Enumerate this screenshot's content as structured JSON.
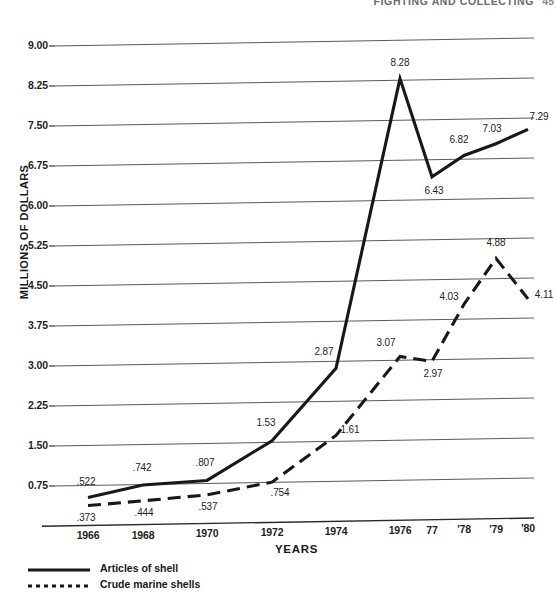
{
  "running_head": {
    "text": "FIGHTING AND COLLECTING",
    "folio": "45"
  },
  "chart_data": {
    "type": "line",
    "title": "",
    "xlabel": "YEARS",
    "ylabel": "MILLIONS OF DOLLARS",
    "x": [
      1966,
      1968,
      1970,
      1972,
      1974,
      1976,
      1977,
      1978,
      1979,
      1980
    ],
    "categories": [
      "1966",
      "1968",
      "1970",
      "1972",
      "1974",
      "1976",
      "77",
      "'78",
      "'79",
      "'80"
    ],
    "ylim": [
      0,
      9
    ],
    "ytick_labels": [
      "9.00",
      "8.25",
      "7.50",
      "6.75",
      "6.00",
      "5.25",
      "4.50",
      "3.75",
      "3.00",
      "2.25",
      "1.50",
      "0.75"
    ],
    "ytick_values": [
      9.0,
      8.25,
      7.5,
      6.75,
      6.0,
      5.25,
      4.5,
      3.75,
      3.0,
      2.25,
      1.5,
      0.75
    ],
    "grid": true,
    "legend_position": "below-left",
    "series": [
      {
        "name": "Articles of shell",
        "style": "solid",
        "color": "#1a1717",
        "values": [
          0.522,
          0.742,
          0.807,
          1.53,
          2.87,
          8.28,
          6.43,
          6.82,
          7.03,
          7.29
        ],
        "labels": [
          ".522",
          ".742",
          ".807",
          "1.53",
          "2.87",
          "8.28",
          "6.43",
          "6.82",
          "7.03",
          "7.29"
        ]
      },
      {
        "name": "Crude marine shells",
        "style": "dashed",
        "color": "#1a1717",
        "values": [
          0.373,
          0.444,
          0.537,
          0.754,
          1.61,
          3.07,
          2.97,
          4.03,
          4.88,
          4.11
        ],
        "labels": [
          ".373",
          ".444",
          ".537",
          ".754",
          "1.61",
          "3.07",
          "2.97",
          "4.03",
          "4.88",
          "4.11"
        ]
      }
    ]
  }
}
